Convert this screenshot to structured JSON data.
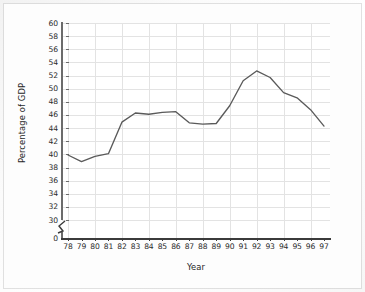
{
  "chart_data": {
    "type": "line",
    "title": "",
    "xlabel": "Year",
    "ylabel": "Percentage of GDP",
    "x": [
      78,
      79,
      80,
      81,
      82,
      83,
      84,
      85,
      86,
      87,
      88,
      89,
      90,
      91,
      92,
      93,
      94,
      95,
      96,
      97
    ],
    "xtick_labels": [
      "78",
      "79",
      "80",
      "81",
      "82",
      "83",
      "84",
      "85",
      "86",
      "87",
      "88",
      "89",
      "90",
      "91",
      "92",
      "93",
      "94",
      "95",
      "96",
      "97"
    ],
    "values": [
      39.9,
      38.9,
      39.7,
      40.1,
      44.9,
      46.3,
      46.1,
      46.4,
      46.5,
      44.8,
      44.6,
      44.7,
      47.4,
      51.2,
      52.7,
      51.7,
      49.4,
      48.6,
      46.8,
      44.3
    ],
    "series": [
      {
        "name": "Percentage of GDP",
        "values": [
          39.9,
          38.9,
          39.7,
          40.1,
          44.9,
          46.3,
          46.1,
          46.4,
          46.5,
          44.8,
          44.6,
          44.7,
          47.4,
          51.2,
          52.7,
          51.7,
          49.4,
          48.6,
          46.8,
          44.3
        ]
      }
    ],
    "ytick_labels": [
      "0",
      "30",
      "32",
      "34",
      "36",
      "38",
      "40",
      "42",
      "44",
      "46",
      "48",
      "50",
      "52",
      "54",
      "56",
      "58",
      "60"
    ],
    "ylim": [
      30,
      60
    ],
    "y_axis_break": true,
    "y_break_between": [
      0,
      30
    ],
    "grid": true,
    "legend": "none",
    "line_color": "#5a5a5a",
    "grid_color": "#e3e3e3",
    "background_color": "#ffffff"
  }
}
